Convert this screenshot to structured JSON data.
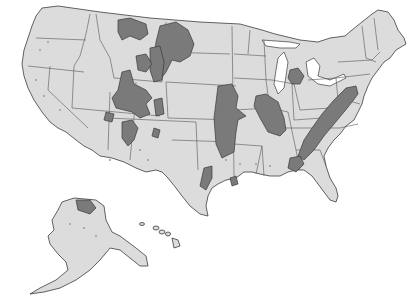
{
  "map": {
    "type": "thematic-choropleth",
    "region": "United States",
    "style": "grayscale",
    "colors": {
      "background": "#ffffff",
      "land": "#dcdcdc",
      "state_border": "#555555",
      "coastline": "#3c3c3c",
      "shaded_area": "#7a7a7a",
      "minor_occurrence_dots": "#9a9a9a"
    },
    "insets": [
      "Alaska",
      "Hawaii"
    ],
    "shaded_regions": [
      "Northern Great Plains (Montana / North Dakota / Wyoming)",
      "Rocky Mountain basins (Wyoming / Colorado / Utah)",
      "San Juan basin (New Mexico)",
      "Raton basin (Colorado / New Mexico)",
      "Michigan basin",
      "Illinois basin",
      "Western Interior (Iowa / Missouri / Kansas / Oklahoma)",
      "Appalachian basin",
      "Black Warrior basin (Alabama)",
      "Texas Gulf region",
      "Arkansas region",
      "North Slope (Alaska)"
    ]
  }
}
